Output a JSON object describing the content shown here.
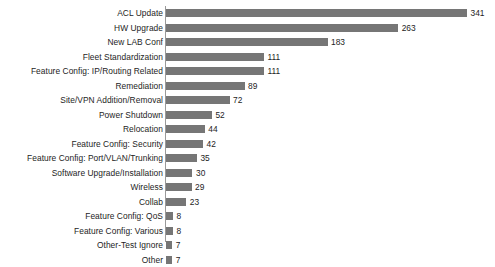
{
  "chart_data": {
    "type": "bar",
    "orientation": "horizontal",
    "title": "",
    "subtitle": "",
    "xlabel": "",
    "ylabel": "",
    "grid": false,
    "legend": null,
    "legend_position": "none",
    "axis_line": "vertical category axis at left of bars",
    "value_labels": true,
    "bar_color": "#767676",
    "background_color": "#ffffff",
    "text_color": "#1d1d1d",
    "xlim": [
      0,
      341
    ],
    "categories": [
      "ACL Update",
      "HW Upgrade",
      "New LAB Conf",
      "Fleet Standardization",
      "Feature Config: IP/Routing Related",
      "Remediation",
      "Site/VPN Addition/Removal",
      "Power Shutdown",
      "Relocation",
      "Feature Config: Security",
      "Feature Config: Port/VLAN/Trunking",
      "Software Upgrade/Installation",
      "Wireless",
      "Collab",
      "Feature Config: QoS",
      "Feature Config: Various",
      "Other-Test Ignore",
      "Other"
    ],
    "values": [
      341,
      263,
      183,
      111,
      111,
      89,
      72,
      52,
      44,
      42,
      35,
      30,
      29,
      23,
      8,
      8,
      7,
      7
    ]
  }
}
